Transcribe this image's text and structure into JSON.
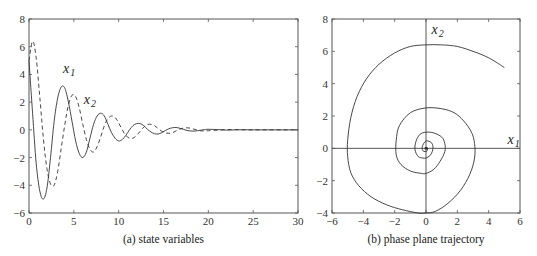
{
  "chart_data": [
    {
      "id": "a",
      "type": "line",
      "caption": "(a)  state variables",
      "xlabel": "",
      "ylabel": "",
      "xlim": [
        0,
        30
      ],
      "ylim": [
        -6,
        8
      ],
      "xticks": [
        0,
        5,
        10,
        15,
        20,
        25,
        30
      ],
      "yticks": [
        -6,
        -4,
        -2,
        0,
        2,
        4,
        6,
        8
      ],
      "grid": false,
      "annotations": [
        {
          "text": "x",
          "sub": "1",
          "x": 3.8,
          "y": 4.1
        },
        {
          "text": "x",
          "sub": "2",
          "x": 6.1,
          "y": 1.9
        }
      ],
      "series": [
        {
          "name": "x1",
          "style": "solid",
          "x": [
            0,
            0.4,
            0.8,
            1.2,
            1.6,
            2.0,
            2.4,
            2.8,
            3.2,
            3.6,
            4.0,
            4.4,
            4.8,
            5.2,
            5.6,
            6.0,
            6.4,
            6.8,
            7.2,
            7.6,
            8.0,
            8.4,
            8.8,
            9.2,
            9.6,
            10.0,
            10.4,
            10.8,
            11.2,
            11.6,
            12.0,
            12.4,
            12.8,
            13.2,
            13.6,
            14.0,
            14.4,
            14.8,
            15.2,
            15.6,
            16.0,
            16.4,
            16.8,
            17.2,
            17.6,
            18.0,
            18.4,
            18.8,
            19.2,
            19.6,
            20.0,
            21.0,
            22.0,
            23.0,
            24.0,
            25.0,
            26.0,
            27.0,
            28.0,
            29.0,
            30.0
          ],
          "y": [
            5.0,
            1.2,
            -2.4,
            -4.4,
            -5.0,
            -4.2,
            -2.0,
            0.6,
            2.3,
            3.1,
            3.0,
            2.0,
            0.6,
            -0.8,
            -1.7,
            -2.0,
            -1.6,
            -0.6,
            0.4,
            1.0,
            1.2,
            1.0,
            0.4,
            -0.2,
            -0.6,
            -0.8,
            -0.7,
            -0.4,
            0.0,
            0.3,
            0.45,
            0.45,
            0.3,
            0.05,
            -0.15,
            -0.28,
            -0.3,
            -0.2,
            -0.05,
            0.08,
            0.15,
            0.17,
            0.12,
            0.04,
            -0.04,
            -0.08,
            -0.09,
            -0.06,
            -0.02,
            0.02,
            0.04,
            0.02,
            -0.02,
            0.0,
            0.01,
            0.0,
            0.0,
            0.0,
            0.0,
            0.0,
            0.0
          ]
        },
        {
          "name": "x2",
          "style": "dashed",
          "x": [
            0,
            0.4,
            0.8,
            1.2,
            1.6,
            2.0,
            2.4,
            2.8,
            3.2,
            3.6,
            4.0,
            4.4,
            4.8,
            5.2,
            5.6,
            6.0,
            6.4,
            6.8,
            7.2,
            7.6,
            8.0,
            8.4,
            8.8,
            9.2,
            9.6,
            10.0,
            10.4,
            10.8,
            11.2,
            11.6,
            12.0,
            12.4,
            12.8,
            13.2,
            13.6,
            14.0,
            14.4,
            14.8,
            15.2,
            15.6,
            16.0,
            16.4,
            16.8,
            17.2,
            17.6,
            18.0,
            18.4,
            18.8,
            19.2,
            19.6,
            20.0,
            21.0,
            22.0,
            23.0,
            24.0,
            25.0,
            26.0,
            27.0,
            28.0,
            29.0,
            30.0
          ],
          "y": [
            5.0,
            6.4,
            5.2,
            2.4,
            -0.6,
            -2.8,
            -3.9,
            -4.0,
            -3.0,
            -1.3,
            0.4,
            1.8,
            2.5,
            2.4,
            1.6,
            0.4,
            -0.7,
            -1.4,
            -1.6,
            -1.2,
            -0.5,
            0.3,
            0.8,
            1.0,
            0.9,
            0.5,
            0.0,
            -0.4,
            -0.6,
            -0.6,
            -0.4,
            -0.1,
            0.2,
            0.38,
            0.4,
            0.3,
            0.1,
            -0.1,
            -0.22,
            -0.25,
            -0.2,
            -0.08,
            0.05,
            0.13,
            0.15,
            0.12,
            0.05,
            -0.02,
            -0.07,
            -0.08,
            -0.06,
            -0.02,
            0.02,
            0.02,
            0.0,
            0.0,
            0.0,
            0.0,
            0.0,
            0.0,
            0.0
          ]
        }
      ]
    },
    {
      "id": "b",
      "type": "line",
      "caption": "(b)  phase plane trajectory",
      "xlabel": "",
      "ylabel": "",
      "xlim": [
        -6,
        6
      ],
      "ylim": [
        -4,
        8
      ],
      "xticks": [
        -6,
        -4,
        -2,
        0,
        2,
        4,
        6
      ],
      "yticks": [
        -4,
        -2,
        0,
        2,
        4,
        6,
        8
      ],
      "grid": false,
      "axes_through_origin": true,
      "annotations": [
        {
          "text": "x",
          "sub": "1",
          "x": 5.2,
          "y": 0.25
        },
        {
          "text": "x",
          "sub": "2",
          "x": 0.35,
          "y": 7.1
        }
      ],
      "series": [
        {
          "name": "trajectory",
          "style": "solid",
          "x": [
            5.0,
            4.0,
            3.0,
            2.0,
            1.0,
            0.0,
            -1.0,
            -2.0,
            -3.0,
            -3.8,
            -4.4,
            -4.8,
            -5.0,
            -5.0,
            -4.8,
            -4.3,
            -3.5,
            -2.5,
            -1.5,
            -0.5,
            0.0,
            0.6,
            1.4,
            2.2,
            2.8,
            3.1,
            3.1,
            2.9,
            2.4,
            1.8,
            1.0,
            0.0,
            -1.0,
            -1.7,
            -1.9,
            -1.9,
            -1.6,
            -1.0,
            -0.3,
            0.0,
            0.5,
            0.9,
            1.2,
            1.2,
            1.0,
            0.5,
            0.0,
            -0.4,
            -0.65,
            -0.7,
            -0.5,
            -0.2,
            0.0,
            0.25,
            0.4,
            0.45,
            0.35,
            0.15,
            0.0,
            -0.15,
            -0.25,
            -0.2,
            -0.05,
            0.05,
            0.1,
            0.08,
            0.0
          ],
          "y": [
            5.0,
            5.6,
            6.0,
            6.3,
            6.4,
            6.4,
            6.3,
            5.9,
            5.2,
            4.3,
            3.2,
            1.9,
            0.5,
            -0.5,
            -1.5,
            -2.3,
            -3.0,
            -3.5,
            -3.8,
            -4.0,
            -4.0,
            -3.9,
            -3.4,
            -2.6,
            -1.6,
            -0.6,
            0.3,
            1.0,
            1.7,
            2.2,
            2.45,
            2.5,
            2.2,
            1.4,
            0.5,
            -0.4,
            -1.0,
            -1.4,
            -1.55,
            -1.55,
            -1.3,
            -0.8,
            -0.2,
            0.3,
            0.7,
            0.95,
            1.0,
            0.85,
            0.4,
            -0.1,
            -0.5,
            -0.6,
            -0.6,
            -0.45,
            -0.2,
            0.1,
            0.35,
            0.45,
            0.45,
            0.3,
            0.05,
            -0.15,
            -0.2,
            -0.18,
            -0.05,
            0.05,
            0.0
          ]
        }
      ]
    }
  ]
}
